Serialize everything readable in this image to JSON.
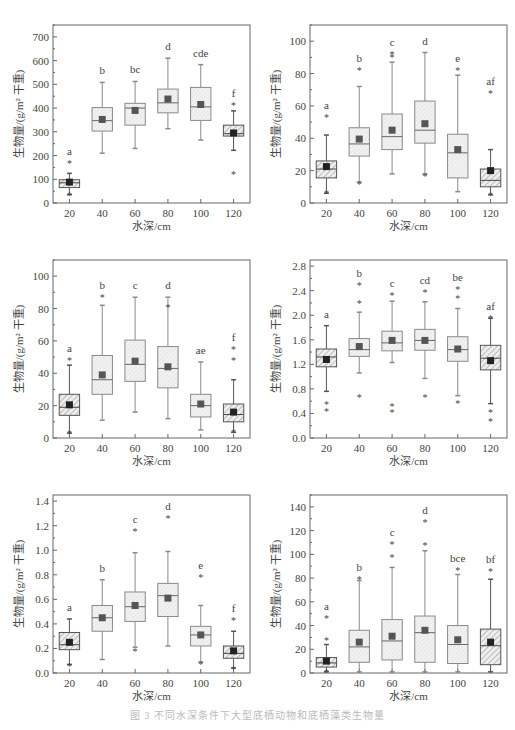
{
  "figure": {
    "caption": "图 3  不同水深条件下大型底栖动物和底栖藻类生物量",
    "colors": {
      "axis": "#666666",
      "box_fill_light": "#eeeeee",
      "box_fill_hatch": "#bbbbbb",
      "hatch_line": "#999999",
      "mean_marker": "#444444",
      "text": "#444444"
    }
  },
  "chart_data": [
    {
      "id": "a",
      "type": "box",
      "title": "(a)河蚌",
      "xlabel": "水深/cm",
      "ylabel": "生物量/(g/m² 干重)",
      "categories": [
        "20",
        "40",
        "60",
        "80",
        "100",
        "120"
      ],
      "ylim": [
        0,
        750
      ],
      "yticks": [
        0,
        100,
        200,
        300,
        400,
        500,
        600,
        700
      ],
      "grid": false,
      "boxes": [
        {
          "x": "20",
          "q1": 65,
          "median": 85,
          "q3": 98,
          "whisker_low": 35,
          "whisker_high": 125,
          "mean": 88,
          "outliers": [
            168,
            35
          ],
          "letter": "a",
          "hatched": true
        },
        {
          "x": "40",
          "q1": 303,
          "median": 347,
          "q3": 402,
          "whisker_low": 210,
          "whisker_high": 508,
          "mean": 352,
          "outliers": [],
          "letter": "b",
          "hatched": false
        },
        {
          "x": "60",
          "q1": 328,
          "median": 400,
          "q3": 420,
          "whisker_low": 230,
          "whisker_high": 512,
          "mean": 390,
          "outliers": [],
          "letter": "bc",
          "hatched": false
        },
        {
          "x": "80",
          "q1": 380,
          "median": 422,
          "q3": 480,
          "whisker_low": 313,
          "whisker_high": 610,
          "mean": 438,
          "outliers": [],
          "letter": "d",
          "hatched": false
        },
        {
          "x": "100",
          "q1": 348,
          "median": 405,
          "q3": 487,
          "whisker_low": 265,
          "whisker_high": 583,
          "mean": 415,
          "outliers": [],
          "letter": "cde",
          "hatched": false
        },
        {
          "x": "120",
          "q1": 282,
          "median": 292,
          "q3": 328,
          "whisker_low": 222,
          "whisker_high": 388,
          "mean": 295,
          "outliers": [
            413,
            122
          ],
          "letter": "f",
          "hatched": true
        }
      ]
    },
    {
      "id": "b",
      "type": "box",
      "title": "(b)龙虱",
      "xlabel": "水深/cm",
      "ylabel": "生物量/(g/m² 干重)",
      "categories": [
        "20",
        "40",
        "60",
        "80",
        "100",
        "120"
      ],
      "ylim": [
        0,
        110
      ],
      "yticks": [
        0,
        20,
        40,
        60,
        80,
        100
      ],
      "grid": false,
      "boxes": [
        {
          "x": "20",
          "q1": 15.5,
          "median": 21,
          "q3": 26,
          "whisker_low": 6,
          "whisker_high": 42,
          "mean": 22.5,
          "outliers": [
            53,
            6
          ],
          "letter": "a",
          "hatched": true
        },
        {
          "x": "40",
          "q1": 29,
          "median": 36.5,
          "q3": 46.5,
          "whisker_low": 13,
          "whisker_high": 72,
          "mean": 39.5,
          "outliers": [
            82.5,
            12
          ],
          "letter": "b",
          "hatched": false
        },
        {
          "x": "60",
          "q1": 33,
          "median": 41,
          "q3": 55,
          "whisker_low": 18,
          "whisker_high": 87,
          "mean": 45,
          "outliers": [
            92,
            90
          ],
          "letter": "c",
          "hatched": false
        },
        {
          "x": "80",
          "q1": 37,
          "median": 45,
          "q3": 63,
          "whisker_low": 18,
          "whisker_high": 93,
          "mean": 49,
          "outliers": [
            16.5
          ],
          "letter": "d",
          "hatched": false
        },
        {
          "x": "100",
          "q1": 15.5,
          "median": 31,
          "q3": 42.5,
          "whisker_low": 7,
          "whisker_high": 79,
          "mean": 33,
          "outliers": [
            82.5
          ],
          "letter": "e",
          "hatched": false
        },
        {
          "x": "120",
          "q1": 10,
          "median": 14,
          "q3": 21,
          "whisker_low": 5,
          "whisker_high": 33,
          "mean": 20,
          "outliers": [
            68,
            5
          ],
          "letter": "af",
          "hatched": true
        }
      ]
    },
    {
      "id": "c",
      "type": "box",
      "title": "(c)东北田螺",
      "xlabel": "水深/cm",
      "ylabel": "生物量/(g/m² 干重)",
      "categories": [
        "20",
        "40",
        "60",
        "80",
        "100",
        "120"
      ],
      "ylim": [
        0,
        110
      ],
      "yticks": [
        0,
        20,
        40,
        60,
        80,
        100
      ],
      "grid": false,
      "boxes": [
        {
          "x": "20",
          "q1": 14,
          "median": 19,
          "q3": 27,
          "whisker_low": 3,
          "whisker_high": 45,
          "mean": 20.5,
          "outliers": [
            48,
            3
          ],
          "letter": "a",
          "hatched": true
        },
        {
          "x": "40",
          "q1": 27,
          "median": 36,
          "q3": 51,
          "whisker_low": 11,
          "whisker_high": 82,
          "mean": 39,
          "outliers": [
            87
          ],
          "letter": "b",
          "hatched": false
        },
        {
          "x": "60",
          "q1": 35,
          "median": 45.5,
          "q3": 60.5,
          "whisker_low": 16,
          "whisker_high": 87,
          "mean": 47.5,
          "outliers": [],
          "letter": "c",
          "hatched": false
        },
        {
          "x": "80",
          "q1": 31,
          "median": 43,
          "q3": 56.5,
          "whisker_low": 12,
          "whisker_high": 87,
          "mean": 44,
          "outliers": [
            81
          ],
          "letter": "d",
          "hatched": false
        },
        {
          "x": "100",
          "q1": 13,
          "median": 20,
          "q3": 27,
          "whisker_low": 5,
          "whisker_high": 47,
          "mean": 21,
          "outliers": [],
          "letter": "ae",
          "hatched": false
        },
        {
          "x": "120",
          "q1": 10,
          "median": 14.5,
          "q3": 21,
          "whisker_low": 3.5,
          "whisker_high": 36,
          "mean": 16,
          "outliers": [
            55,
            48,
            3.5
          ],
          "letter": "f",
          "hatched": true
        }
      ]
    },
    {
      "id": "d",
      "type": "box",
      "title": "(d)蜻蜓目",
      "xlabel": "水深/cm",
      "ylabel": "生物量/(g/m² 干重)",
      "categories": [
        "20",
        "40",
        "60",
        "80",
        "100",
        "120"
      ],
      "ylim": [
        0,
        2.9
      ],
      "yticks": [
        0.0,
        0.4,
        0.8,
        1.2,
        1.6,
        2.0,
        2.4,
        2.8
      ],
      "grid": false,
      "boxes": [
        {
          "x": "20",
          "q1": 1.16,
          "median": 1.32,
          "q3": 1.45,
          "whisker_low": 0.76,
          "whisker_high": 1.83,
          "mean": 1.28,
          "outliers": [
            0.55,
            0.44
          ],
          "letter": "a",
          "hatched": true
        },
        {
          "x": "40",
          "q1": 1.33,
          "median": 1.44,
          "q3": 1.62,
          "whisker_low": 1.06,
          "whisker_high": 2.05,
          "mean": 1.49,
          "outliers": [
            2.2,
            2.5,
            0.66
          ],
          "letter": "b",
          "hatched": false
        },
        {
          "x": "60",
          "q1": 1.42,
          "median": 1.55,
          "q3": 1.74,
          "whisker_low": 1.23,
          "whisker_high": 2.23,
          "mean": 1.59,
          "outliers": [
            2.33,
            0.52,
            0.42
          ],
          "letter": "c",
          "hatched": false
        },
        {
          "x": "80",
          "q1": 1.43,
          "median": 1.59,
          "q3": 1.77,
          "whisker_low": 0.97,
          "whisker_high": 2.22,
          "mean": 1.59,
          "outliers": [
            2.38,
            0.67
          ],
          "letter": "cd",
          "hatched": false
        },
        {
          "x": "100",
          "q1": 1.25,
          "median": 1.44,
          "q3": 1.65,
          "whisker_low": 0.69,
          "whisker_high": 2.11,
          "mean": 1.45,
          "outliers": [
            2.28,
            2.42,
            0.57
          ],
          "letter": "be",
          "hatched": false
        },
        {
          "x": "120",
          "q1": 1.11,
          "median": 1.3,
          "q3": 1.51,
          "whisker_low": 0.56,
          "whisker_high": 1.95,
          "mean": 1.26,
          "outliers": [
            1.95,
            0.42,
            0.28
          ],
          "letter": "af",
          "hatched": true
        }
      ]
    },
    {
      "id": "e",
      "type": "box",
      "title": "(e)摇蚊科幼虫",
      "xlabel": "水深/cm",
      "ylabel": "生物量/(g/m² 干重)",
      "categories": [
        "20",
        "40",
        "60",
        "80",
        "100",
        "120"
      ],
      "ylim": [
        0,
        1.45
      ],
      "yticks": [
        0.0,
        0.2,
        0.4,
        0.6,
        0.8,
        1.0,
        1.2,
        1.4
      ],
      "grid": false,
      "boxes": [
        {
          "x": "20",
          "q1": 0.19,
          "median": 0.23,
          "q3": 0.33,
          "whisker_low": 0.07,
          "whisker_high": 0.44,
          "mean": 0.25,
          "outliers": [
            0.06
          ],
          "letter": "a",
          "hatched": true
        },
        {
          "x": "40",
          "q1": 0.34,
          "median": 0.45,
          "q3": 0.55,
          "whisker_low": 0.11,
          "whisker_high": 0.76,
          "mean": 0.45,
          "outliers": [],
          "letter": "b",
          "hatched": false
        },
        {
          "x": "60",
          "q1": 0.42,
          "median": 0.54,
          "q3": 0.66,
          "whisker_low": 0.21,
          "whisker_high": 0.98,
          "mean": 0.55,
          "outliers": [
            1.16,
            0.18
          ],
          "letter": "c",
          "hatched": false
        },
        {
          "x": "80",
          "q1": 0.46,
          "median": 0.63,
          "q3": 0.73,
          "whisker_low": 0.22,
          "whisker_high": 0.99,
          "mean": 0.61,
          "outliers": [
            1.26
          ],
          "letter": "d",
          "hatched": false
        },
        {
          "x": "100",
          "q1": 0.22,
          "median": 0.31,
          "q3": 0.38,
          "whisker_low": 0.09,
          "whisker_high": 0.55,
          "mean": 0.31,
          "outliers": [
            0.78,
            0.07
          ],
          "letter": "e",
          "hatched": false
        },
        {
          "x": "120",
          "q1": 0.12,
          "median": 0.16,
          "q3": 0.22,
          "whisker_low": 0.04,
          "whisker_high": 0.34,
          "mean": 0.18,
          "outliers": [
            0.43,
            0.03
          ],
          "letter": "f",
          "hatched": true
        }
      ]
    },
    {
      "id": "f",
      "type": "box",
      "title": "(f)底栖藻类(绿藻)",
      "xlabel": "水深/cm",
      "ylabel": "生物量/(g/m² 干重)",
      "categories": [
        "20",
        "40",
        "60",
        "80",
        "100",
        "120"
      ],
      "ylim": [
        0,
        150
      ],
      "yticks": [
        0,
        20,
        40,
        60,
        80,
        100,
        120,
        140
      ],
      "grid": false,
      "boxes": [
        {
          "x": "20",
          "q1": 5,
          "median": 8.5,
          "q3": 13,
          "whisker_low": 1,
          "whisker_high": 24,
          "mean": 10,
          "outliers": [
            46,
            28,
            1
          ],
          "letter": "a",
          "hatched": true
        },
        {
          "x": "40",
          "q1": 9,
          "median": 22,
          "q3": 36,
          "whisker_low": 1,
          "whisker_high": 78,
          "mean": 26,
          "outliers": [
            79
          ],
          "letter": "b",
          "hatched": false
        },
        {
          "x": "60",
          "q1": 11,
          "median": 27,
          "q3": 45,
          "whisker_low": 1,
          "whisker_high": 89,
          "mean": 31,
          "outliers": [
            109,
            98
          ],
          "letter": "c",
          "hatched": false
        },
        {
          "x": "80",
          "q1": 9,
          "median": 34,
          "q3": 48,
          "whisker_low": 1,
          "whisker_high": 103,
          "mean": 36,
          "outliers": [
            127,
            108
          ],
          "letter": "d",
          "hatched": false
        },
        {
          "x": "100",
          "q1": 8,
          "median": 24,
          "q3": 40,
          "whisker_low": 1,
          "whisker_high": 83,
          "mean": 28,
          "outliers": [
            87
          ],
          "letter": "bce",
          "hatched": false
        },
        {
          "x": "120",
          "q1": 7,
          "median": 23,
          "q3": 37,
          "whisker_low": 1,
          "whisker_high": 79,
          "mean": 26,
          "outliers": [
            86
          ],
          "letter": "bf",
          "hatched": true
        }
      ]
    }
  ]
}
